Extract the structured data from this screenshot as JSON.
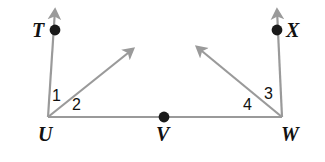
{
  "figure": {
    "kind": "geometry-diagram",
    "width": 325,
    "height": 162,
    "background_color": "#ffffff",
    "line_color": "#9a9a9a",
    "point_color": "#1a1a1a",
    "label_color": "#111111"
  },
  "points": [
    {
      "name": "T",
      "label": "T",
      "x": 55,
      "y": 30,
      "label_x": 32,
      "label_y": 20,
      "dot": true
    },
    {
      "name": "U",
      "label": "U",
      "x": 48,
      "y": 117,
      "label_x": 38,
      "label_y": 124,
      "dot": false
    },
    {
      "name": "V",
      "label": "V",
      "x": 164,
      "y": 117,
      "label_x": 156,
      "label_y": 124,
      "dot": true
    },
    {
      "name": "W",
      "label": "W",
      "x": 282,
      "y": 117,
      "label_x": 281,
      "label_y": 124,
      "dot": false
    },
    {
      "name": "X",
      "label": "X",
      "x": 277,
      "y": 30,
      "label_x": 286,
      "label_y": 20,
      "dot": true
    }
  ],
  "angles": [
    {
      "name": "angle-1",
      "label": "1",
      "x": 52,
      "y": 88,
      "vertex": "U"
    },
    {
      "name": "angle-2",
      "label": "2",
      "x": 72,
      "y": 97,
      "vertex": "U"
    },
    {
      "name": "angle-3",
      "label": "3",
      "x": 264,
      "y": 86,
      "vertex": "W"
    },
    {
      "name": "angle-4",
      "label": "4",
      "x": 243,
      "y": 97,
      "vertex": "W"
    }
  ],
  "segments": [
    {
      "name": "segment-uw",
      "from": "U",
      "to": "W",
      "x1": 48,
      "y1": 117,
      "x2": 282,
      "y2": 117,
      "arrow": "none"
    },
    {
      "name": "ray-ut",
      "from": "U",
      "to": "T",
      "x1": 48,
      "y1": 117,
      "x2": 55,
      "y2": 8,
      "arrow": "end"
    },
    {
      "name": "ray-wx",
      "from": "W",
      "to": "X",
      "x1": 282,
      "y1": 117,
      "x2": 277,
      "y2": 8,
      "arrow": "end"
    },
    {
      "name": "ray-u-diagonal",
      "from": "U",
      "to": "upper-right",
      "x1": 48,
      "y1": 117,
      "x2": 134,
      "y2": 48,
      "arrow": "end"
    },
    {
      "name": "ray-w-diagonal",
      "from": "W",
      "to": "upper-left",
      "x1": 282,
      "y1": 117,
      "x2": 196,
      "y2": 46,
      "arrow": "end"
    }
  ]
}
